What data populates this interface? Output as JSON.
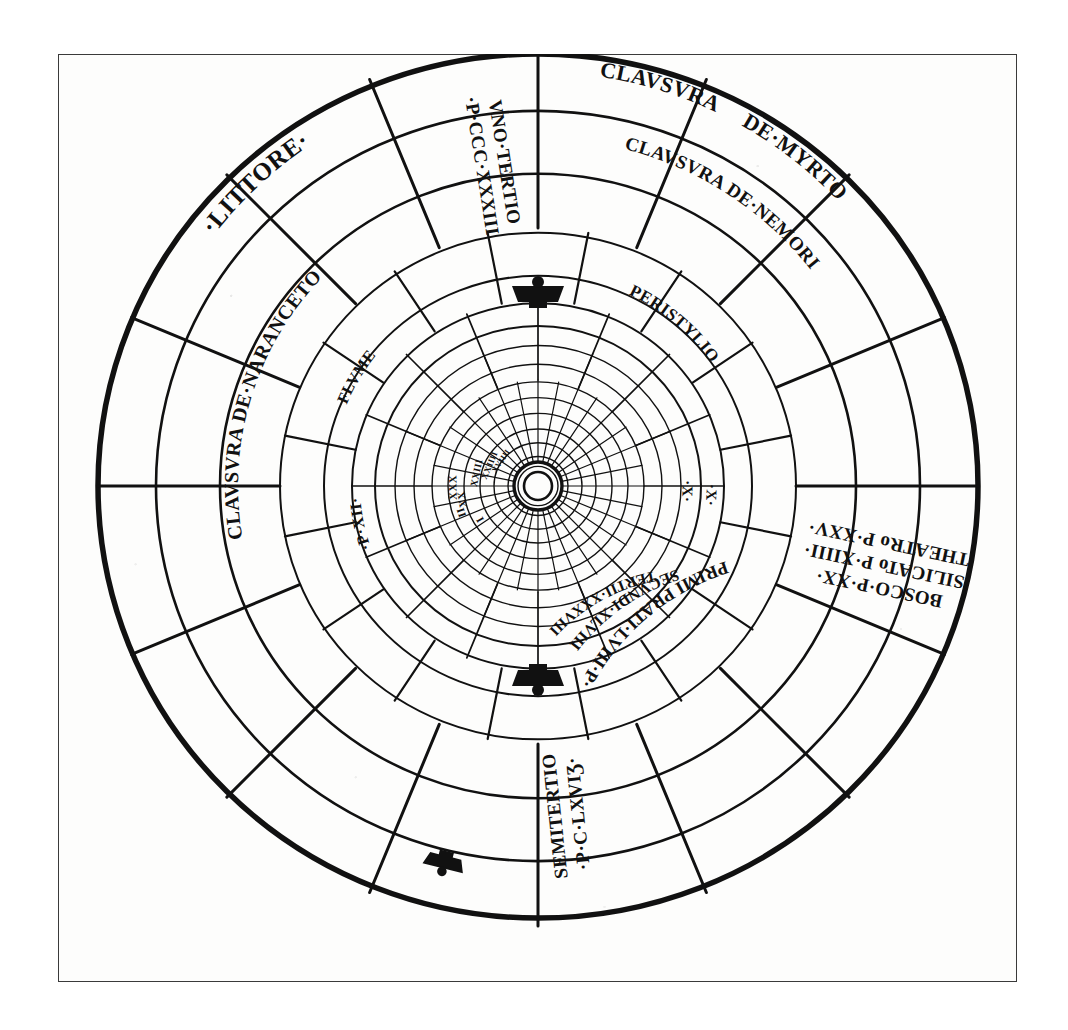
{
  "plate": {
    "kind": "woodcut-radial-plan",
    "title_visible": false,
    "ink_color": "#111111",
    "paper_color": "#fdfdfc",
    "frame_color": "#3a3a3a"
  },
  "geometry": {
    "center_x": 480,
    "center_y": 432,
    "outer_radius": 440,
    "ring_radii": [
      440,
      382,
      318,
      258,
      214,
      186,
      163,
      143,
      124,
      106,
      90,
      74,
      58,
      44,
      30,
      20
    ],
    "outer_spoke_count": 16,
    "outer_spoke_start_deg": -90,
    "mid_spoke_count": 16,
    "core_spoke_count": 32,
    "hub_inner_radius": 14,
    "hub_outer_radius": 24
  },
  "labels": {
    "outer_ring": [
      {
        "id": "littore",
        "text": "·LITTORE·",
        "angle_deg": -133,
        "radius": 410,
        "size": 25,
        "flip": false
      },
      {
        "id": "clausura_myrto_1",
        "text": "CLAVSVRA",
        "angle_deg": -73,
        "radius": 414,
        "size": 22,
        "flip": false
      },
      {
        "id": "clausura_myrto_2",
        "text": "DE·MYRTO",
        "angle_deg": -52,
        "radius": 414,
        "size": 22,
        "flip": false
      },
      {
        "id": "bosco_silicato_theatro",
        "text": "BOSCO·P·XX· SILICATo P·XIIII· THEATRo P·XXV·",
        "angle_deg": 12,
        "radius": 355,
        "size": 19,
        "flip": true
      }
    ],
    "bosco_lines": [
      "BOSCO·P·XX·",
      "SILICATo P·XIIII·",
      "THEATRo P·XXV·"
    ],
    "spoke_labels": [
      {
        "id": "vno_tertio",
        "lines": [
          "VNO·TERTIO",
          "·P·CCC·XXXIII"
        ],
        "angle_deg": -99,
        "r_from": 250,
        "r_to": 400,
        "size": 19
      },
      {
        "id": "semitertio",
        "lines": [
          "SEMITERTIO",
          "·P·C·LXVIƷ·"
        ],
        "angle_deg": 84,
        "r_from": 260,
        "r_to": 400,
        "size": 19
      }
    ],
    "inner_ring": [
      {
        "id": "clausura_nemori",
        "text": "CLAVSVRA DE·NEMORI",
        "angle_deg": -57,
        "radius": 348,
        "size": 19,
        "flip": false
      },
      {
        "id": "clausura_naranceto",
        "text": "CLAVSVRA DE·NARANCETO",
        "angle_deg": -163,
        "radius": 300,
        "size": 20,
        "flip": false
      },
      {
        "id": "peristylio",
        "text": "PERISTYLIO",
        "angle_deg": -50,
        "radius": 212,
        "size": 17,
        "flip": false
      },
      {
        "id": "flume",
        "text": "FLVME",
        "angle_deg": -149,
        "radius": 208,
        "size": 16,
        "flip": false
      },
      {
        "id": "p_xii",
        "text": "·P·XII·",
        "angle_deg": 168,
        "radius": 178,
        "size": 16,
        "flip": false
      }
    ],
    "prati_ring": [
      {
        "id": "primi_prati",
        "text": "PRIMI PRATI·LVIII·P·",
        "angle_deg": 50,
        "radius": 250,
        "size": 18,
        "flip": true
      },
      {
        "id": "secundi",
        "text": "SECVNDI·XLVIII",
        "angle_deg": 55,
        "radius": 216,
        "size": 16,
        "flip": true
      },
      {
        "id": "tertii",
        "text": "TERTII·XXXVIII",
        "angle_deg": 61,
        "radius": 190,
        "size": 15,
        "flip": true
      }
    ],
    "core_numerals": [
      {
        "id": "num-i",
        "text": "I",
        "angle_deg": 150,
        "radius": 66,
        "size": 11
      },
      {
        "id": "num-ii",
        "text": "II",
        "angle_deg": 161,
        "radius": 80,
        "size": 11
      },
      {
        "id": "num-xx",
        "text": "XX",
        "angle_deg": 170,
        "radius": 76,
        "size": 11
      },
      {
        "id": "num-xxx",
        "text": "XXX",
        "angle_deg": 179,
        "radius": 84,
        "size": 11
      },
      {
        "id": "num-xxiii",
        "text": "XXIII",
        "angle_deg": 192,
        "radius": 62,
        "size": 10
      },
      {
        "id": "num-xxiiii",
        "text": "XXIIII",
        "angle_deg": 203,
        "radius": 52,
        "size": 9
      },
      {
        "id": "num-xviiii",
        "text": "XVIIII",
        "angle_deg": 214,
        "radius": 44,
        "size": 8
      }
    ],
    "tick_marks": [
      {
        "id": "tick-x-outer",
        "text": "·X·",
        "angle_deg": 3,
        "radius": 172,
        "size": 15
      },
      {
        "id": "tick-x-inner",
        "text": "·X·",
        "angle_deg": 2,
        "radius": 148,
        "size": 15
      }
    ]
  },
  "ornaments": {
    "name": "crown-gate-ornament",
    "count": 3,
    "positions_deg": [
      -90,
      90,
      104
    ],
    "radii": [
      200,
      200,
      394
    ]
  }
}
